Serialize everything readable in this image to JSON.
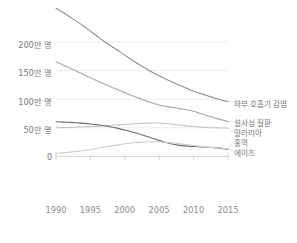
{
  "chart_data": {
    "type": "line",
    "title": "",
    "subtitle": "",
    "xlabel": "",
    "ylabel": "",
    "x": [
      1990,
      1991,
      1992,
      1993,
      1994,
      1995,
      1996,
      1997,
      1998,
      1999,
      2000,
      2001,
      2002,
      2003,
      2004,
      2005,
      2006,
      2007,
      2008,
      2009,
      2010,
      2011,
      2012,
      2013,
      2014,
      2015
    ],
    "xlim": [
      1990,
      2015
    ],
    "ylim": [
      0,
      2600000
    ],
    "grid": true,
    "grid_axis": "y",
    "legend_position": "right-inline",
    "y_ticks": [
      0,
      500000,
      1000000,
      1500000,
      2000000
    ],
    "y_tick_labels": [
      "0",
      "50만 명",
      "100만 명",
      "150만 명",
      "200만 명"
    ],
    "x_ticks": [
      1990,
      1995,
      2000,
      2005,
      2010,
      2015
    ],
    "x_tick_labels": [
      "1990",
      "1995",
      "2000",
      "2005",
      "2010",
      "2015"
    ],
    "series": [
      {
        "name": "하부 호흡기 감염",
        "label": "하부 호흡기 감염",
        "color": "#8f8f8f",
        "values": [
          2590000,
          2520000,
          2440000,
          2360000,
          2280000,
          2190000,
          2100000,
          2010000,
          1930000,
          1850000,
          1770000,
          1690000,
          1610000,
          1540000,
          1470000,
          1410000,
          1350000,
          1290000,
          1240000,
          1190000,
          1140000,
          1100000,
          1060000,
          1020000,
          985000,
          955000
        ]
      },
      {
        "name": "설사성 질환",
        "label": "설사성 질환",
        "color": "#a8a8a8",
        "values": [
          1655000,
          1600000,
          1545000,
          1490000,
          1430000,
          1375000,
          1320000,
          1265000,
          1215000,
          1165000,
          1115000,
          1065000,
          1020000,
          975000,
          935000,
          900000,
          875000,
          855000,
          835000,
          815000,
          790000,
          750000,
          710000,
          675000,
          640000,
          610000
        ]
      },
      {
        "name": "말라리아",
        "label": "말라리아",
        "color": "#c4c4c4",
        "values": [
          500000,
          503000,
          507000,
          512000,
          518000,
          524000,
          530000,
          537000,
          544000,
          552000,
          560000,
          567000,
          574000,
          580000,
          585000,
          583000,
          575000,
          562000,
          548000,
          534000,
          522000,
          512000,
          505000,
          500000,
          497000,
          495000
        ]
      },
      {
        "name": "홍역",
        "label": "홍역",
        "color": "#6b6b6b",
        "values": [
          605000,
          600000,
          594000,
          587000,
          578000,
          567000,
          553000,
          536000,
          515000,
          490000,
          462000,
          430000,
          395000,
          357000,
          318000,
          280000,
          242000,
          212000,
          192000,
          180000,
          172000,
          166000,
          160000,
          152000,
          140000,
          125000
        ]
      },
      {
        "name": "에이즈",
        "label": "에이즈",
        "color": "#cccccc",
        "values": [
          52000,
          62000,
          74000,
          88000,
          104000,
          122000,
          142000,
          162000,
          182000,
          202000,
          220000,
          235000,
          246000,
          253000,
          256000,
          254000,
          246000,
          234000,
          220000,
          205000,
          190000,
          176000,
          163000,
          152000,
          142000,
          135000
        ]
      }
    ]
  },
  "axis": {
    "y_labels": [
      "200만 명",
      "150만 명",
      "100만 명",
      "50만 명",
      "0"
    ],
    "x_labels": [
      "1990",
      "1995",
      "2000",
      "2005",
      "2010",
      "2015"
    ]
  },
  "legend": {
    "items": [
      {
        "label": "하부 호흡기 감염"
      },
      {
        "label": "설사성 질환"
      },
      {
        "label": "말라리아"
      },
      {
        "label": "홍역"
      },
      {
        "label": "에이즈"
      }
    ]
  }
}
